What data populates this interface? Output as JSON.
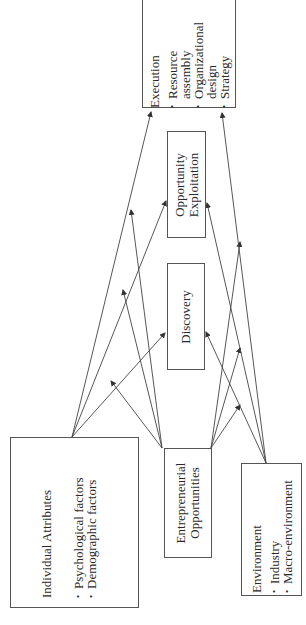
{
  "diagram": {
    "orientation": "rotated -90deg",
    "nodes": {
      "individual_attributes": {
        "title": "Individual Attributes",
        "items": [
          "Psychological factors",
          "Demographic factors"
        ]
      },
      "entrepreneurial_opportunities": {
        "line1": "Entrepreneurial",
        "line2": "Opportunities"
      },
      "environment": {
        "title": "Environment",
        "items": [
          "Industry",
          "Macro-environment"
        ]
      },
      "discovery": {
        "label": "Discovery"
      },
      "opportunity_exploitation": {
        "line1": "Opportunity",
        "line2": "Exploitation"
      },
      "execution": {
        "title": "Execution",
        "items": [
          "Resource assembly",
          "Organizational design",
          "Strategy"
        ],
        "item_lines": [
          "Resource",
          "assembly",
          "Organizational",
          "design",
          "Strategy"
        ]
      }
    },
    "edges": [
      {
        "from": "Individual Attributes",
        "to": "Discovery"
      },
      {
        "from": "Individual Attributes",
        "to": "Opportunity Exploitation"
      },
      {
        "from": "Individual Attributes",
        "to": "Execution"
      },
      {
        "from": "Entrepreneurial Opportunities",
        "to": "Individual Attributes arrows (moderation)"
      },
      {
        "from": "Entrepreneurial Opportunities",
        "to": "Discovery"
      },
      {
        "from": "Entrepreneurial Opportunities",
        "to": "Opportunity Exploitation"
      },
      {
        "from": "Entrepreneurial Opportunities",
        "to": "Execution"
      },
      {
        "from": "Environment",
        "to": "Discovery"
      },
      {
        "from": "Environment",
        "to": "Opportunity Exploitation"
      },
      {
        "from": "Environment",
        "to": "Execution"
      }
    ],
    "colors": {
      "line": "#444444",
      "text": "#2a2a2a",
      "background": "#ffffff"
    }
  }
}
